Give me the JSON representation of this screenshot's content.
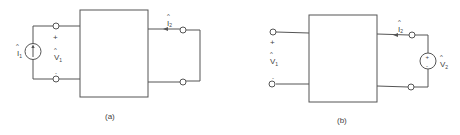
{
  "colors": {
    "line": "#555555",
    "text": "#444444",
    "background": "#ffffff"
  },
  "circuits": [
    {
      "caption": "(a)",
      "source": {
        "type": "current-source",
        "label": "I",
        "subscript": "1",
        "hat": "^"
      },
      "port1": {
        "plus": "+",
        "minus": "-",
        "label": "V",
        "subscript": "1",
        "hat": "^"
      },
      "port2": {
        "current_label": "I",
        "current_subscript": "2",
        "hat": "^",
        "termination": "short-circuit"
      }
    },
    {
      "caption": "(b)",
      "port1": {
        "plus": "+",
        "minus": "-",
        "label": "V",
        "subscript": "1",
        "hat": "^",
        "termination": "open-circuit"
      },
      "port2": {
        "current_label": "I",
        "current_subscript": "2",
        "hat": "^"
      },
      "source": {
        "type": "voltage-source",
        "label": "V",
        "subscript": "2",
        "hat": "^",
        "plus": "+",
        "minus": "-"
      }
    }
  ]
}
